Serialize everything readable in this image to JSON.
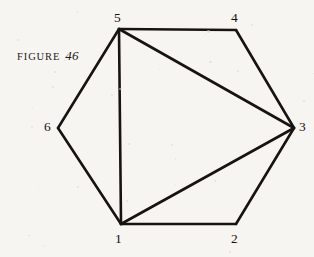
{
  "figure": {
    "caption_word": "FIGURE",
    "caption_number": "46",
    "background_color": "#f7f5f2",
    "ink_color": "#171311",
    "stroke_width": 2.6,
    "width": 314,
    "height": 257
  },
  "chart_data": {
    "type": "diagram",
    "subtype": "graph-hexagon-triangulation",
    "xlim": [
      0,
      314
    ],
    "ylim": [
      0,
      257
    ],
    "grid": false,
    "legend": null,
    "nodes": [
      {
        "id": "1",
        "label": "1",
        "x": 121,
        "y": 224,
        "label_x": 115,
        "label_y": 232,
        "label_anchor": "below",
        "degree": 4
      },
      {
        "id": "2",
        "label": "2",
        "x": 236,
        "y": 224,
        "label_x": 231,
        "label_y": 232,
        "label_anchor": "below",
        "degree": 2
      },
      {
        "id": "3",
        "label": "3",
        "x": 294,
        "y": 128,
        "label_x": 299,
        "label_y": 120,
        "label_anchor": "right",
        "degree": 4
      },
      {
        "id": "4",
        "label": "4",
        "x": 236,
        "y": 30,
        "label_x": 231,
        "label_y": 11,
        "label_anchor": "above",
        "degree": 2
      },
      {
        "id": "5",
        "label": "5",
        "x": 119,
        "y": 29,
        "label_x": 114,
        "label_y": 11,
        "label_anchor": "above",
        "degree": 4
      },
      {
        "id": "6",
        "label": "6",
        "x": 58,
        "y": 128,
        "label_x": 44,
        "label_y": 120,
        "label_anchor": "left",
        "degree": 2
      }
    ],
    "edges": [
      {
        "from": "5",
        "to": "4",
        "kind": "perimeter"
      },
      {
        "from": "4",
        "to": "3",
        "kind": "perimeter"
      },
      {
        "from": "3",
        "to": "2",
        "kind": "perimeter"
      },
      {
        "from": "2",
        "to": "1",
        "kind": "perimeter"
      },
      {
        "from": "1",
        "to": "6",
        "kind": "perimeter"
      },
      {
        "from": "6",
        "to": "5",
        "kind": "perimeter"
      },
      {
        "from": "5",
        "to": "1",
        "kind": "diagonal"
      },
      {
        "from": "5",
        "to": "3",
        "kind": "diagonal"
      },
      {
        "from": "1",
        "to": "3",
        "kind": "diagonal"
      }
    ]
  }
}
